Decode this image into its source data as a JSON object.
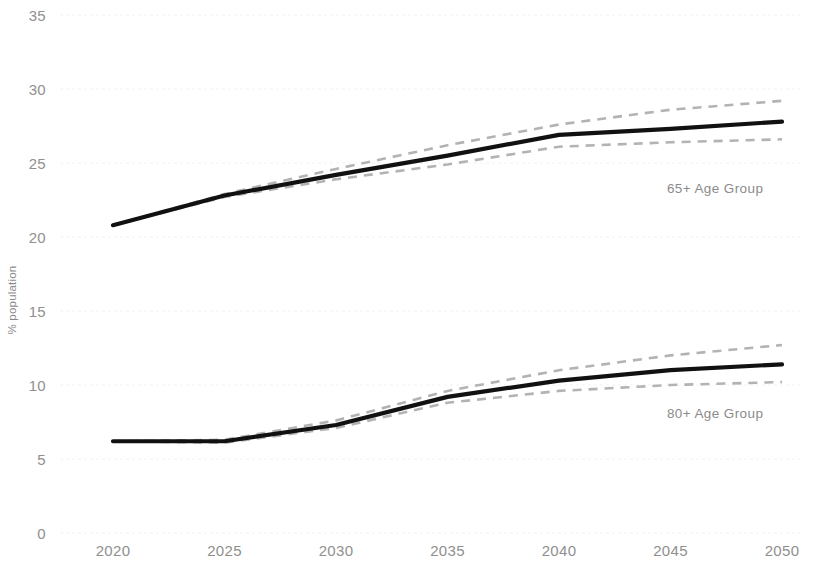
{
  "chart_data": {
    "type": "line",
    "title": "",
    "xlabel": "",
    "ylabel": "% population",
    "x": [
      2020,
      2025,
      2030,
      2035,
      2040,
      2045,
      2050
    ],
    "xticklabels": [
      "2020",
      "2025",
      "2030",
      "2035",
      "2040",
      "2045",
      "2050"
    ],
    "yticklabels": [
      "0",
      "5",
      "10",
      "15",
      "20",
      "25",
      "30",
      "35"
    ],
    "ytickvalues": [
      0,
      5,
      10,
      15,
      20,
      25,
      30,
      35
    ],
    "xlim": [
      2020,
      2050
    ],
    "ylim": [
      0,
      35
    ],
    "grid": true,
    "legend_position": "inline-right-annotation",
    "series": [
      {
        "name": "65+ Age Group",
        "annotation": "65+ Age Group",
        "style": "solid",
        "color": "#111111",
        "values": [
          20.8,
          22.8,
          24.2,
          25.5,
          26.9,
          27.3,
          27.8
        ],
        "upper_bound": {
          "name": "65+ upper projection bound",
          "style": "dashed",
          "color": "#b3b3b3",
          "values": [
            20.8,
            22.9,
            24.6,
            26.2,
            27.6,
            28.6,
            29.2
          ]
        },
        "lower_bound": {
          "name": "65+ lower projection bound",
          "style": "dashed",
          "color": "#b3b3b3",
          "values": [
            20.8,
            22.7,
            23.9,
            24.9,
            26.1,
            26.4,
            26.6
          ]
        }
      },
      {
        "name": "80+ Age Group",
        "annotation": "80+ Age Group",
        "style": "solid",
        "color": "#111111",
        "values": [
          6.2,
          6.2,
          7.3,
          9.2,
          10.3,
          11.0,
          11.4
        ],
        "upper_bound": {
          "name": "80+ upper projection bound",
          "style": "dashed",
          "color": "#b3b3b3",
          "values": [
            6.2,
            6.3,
            7.6,
            9.6,
            11.0,
            12.0,
            12.7
          ]
        },
        "lower_bound": {
          "name": "80+ lower projection bound",
          "style": "dashed",
          "color": "#b3b3b3",
          "values": [
            6.2,
            6.1,
            7.1,
            8.8,
            9.6,
            10.0,
            10.2
          ]
        }
      }
    ],
    "annotations": [
      {
        "text": "65+ Age Group",
        "x": 2047,
        "y": 23.0
      },
      {
        "text": "80+ Age Group",
        "x": 2047,
        "y": 7.8
      }
    ],
    "colors": {
      "background": "#ffffff",
      "line": "#111111",
      "band": "#b3b3b3",
      "grid": "#f2f2f2",
      "tick_text": "#8f8f8f",
      "axis_label": "#8a8a8a"
    }
  }
}
